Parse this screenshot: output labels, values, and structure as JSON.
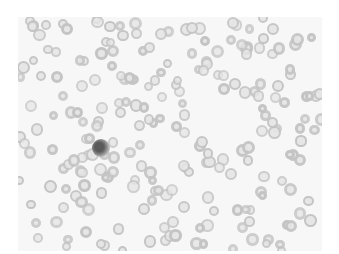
{
  "image": {
    "subject": "peripheral blood smear micrograph",
    "background_color": "#f7f7f7",
    "cell_ring_color": "#c4c4c4",
    "cell_center_color": "#e6e6e6",
    "nucleus_color": "#5a5a5a"
  },
  "photo_frame": {
    "x": 18,
    "y": 17,
    "width": 304,
    "height": 234
  },
  "white_blood_cell": {
    "type": "neutrophil",
    "cx": 101,
    "cy": 148,
    "r": 9
  },
  "seed": 20231,
  "cell_count": 230
}
